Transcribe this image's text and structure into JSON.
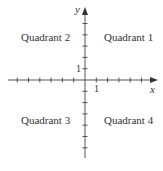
{
  "diagram": {
    "type": "coordinate-plane",
    "axes": {
      "x_label": "x",
      "y_label": "y",
      "x_unit_label": "1",
      "y_unit_label": "1",
      "origin_px": [
        85,
        80
      ],
      "tick_spacing_px": 11.3,
      "x_ticks_negative": 6,
      "x_ticks_positive": 5,
      "y_ticks_positive": 5,
      "y_ticks_negative": 6,
      "color": "#444444"
    },
    "quadrants": [
      {
        "id": 1,
        "label": "Quadrant 1"
      },
      {
        "id": 2,
        "label": "Quadrant 2"
      },
      {
        "id": 3,
        "label": "Quadrant 3"
      },
      {
        "id": 4,
        "label": "Quadrant 4"
      }
    ]
  }
}
